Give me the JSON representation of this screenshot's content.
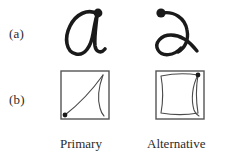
{
  "figure": {
    "background_color": "#ffffff",
    "ink_color": "#1a1a1a",
    "trace_color": "#4a4a4a",
    "box_border_color": "#555555",
    "rows": [
      {
        "id": "a",
        "label": "(a)",
        "description": "handwritten cursive letter a samples"
      },
      {
        "id": "b",
        "label": "(b)",
        "description": "stroke trajectory inside bounding box"
      }
    ],
    "columns": [
      {
        "id": "primary",
        "caption": "Primary"
      },
      {
        "id": "alternative",
        "caption": "Alternative"
      }
    ],
    "glyphs": [
      {
        "id": "glyph-primary",
        "letter": "a",
        "style": "primary allograph",
        "start_dot": {
          "position": "top-right"
        }
      },
      {
        "id": "glyph-alternative",
        "letter": "a",
        "style": "alternative allograph",
        "start_dot": {
          "position": "top-left"
        }
      }
    ],
    "boxes": [
      {
        "id": "box-primary",
        "caption": "Primary",
        "start_dot": {
          "position": "bottom-left"
        },
        "trace": "arc from bottom-left to top-right with return curve down right side"
      },
      {
        "id": "box-alternative",
        "caption": "Alternative",
        "start_dot": {
          "position": "top-right"
        },
        "trace": "rounded square loop with return curve down right side"
      }
    ]
  }
}
